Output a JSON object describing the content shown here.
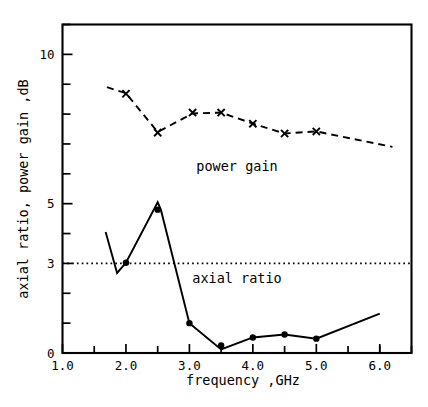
{
  "chart_data": {
    "type": "line",
    "title": "",
    "xlabel": "frequency ,GHz",
    "ylabel": "axial ratio, power gain ,dB",
    "xlim": [
      1.0,
      6.5
    ],
    "ylim": [
      0,
      11.0
    ],
    "grid": false,
    "legend_position": "inline-annotation",
    "x_tick_labels": [
      "1.0",
      "2.0",
      "3.0",
      "4.0",
      "5.0",
      "6.0"
    ],
    "x_tick_values": [
      1.0,
      2.0,
      3.0,
      4.0,
      5.0,
      6.0
    ],
    "x_minor_tick_values": [
      1.5,
      2.5,
      3.5,
      4.5,
      5.5,
      6.0,
      6.5
    ],
    "y_tick_labels": [
      "0",
      "3",
      "5",
      "10"
    ],
    "y_tick_values": [
      0,
      3,
      5,
      10
    ],
    "y_minor_tick_values": [
      1,
      2,
      4,
      6,
      7,
      8,
      9,
      11
    ],
    "reference_lines": [
      {
        "name": "axial-ratio-3dB-threshold",
        "value": 3,
        "axis": "y",
        "style": "dotted",
        "label": ""
      }
    ],
    "series": [
      {
        "name": "power gain",
        "annotation": "power gain",
        "annotation_x": 3.75,
        "annotation_y": 6.1,
        "style": "dashed",
        "marker": "x",
        "line_x": [
          1.7,
          2.0,
          2.5,
          3.05,
          3.5,
          4.0,
          4.5,
          5.0,
          6.2
        ],
        "line_y": [
          8.9,
          8.7,
          7.4,
          8.02,
          8.05,
          7.68,
          7.35,
          7.42,
          6.9
        ],
        "marker_x": [
          2.0,
          2.5,
          3.05,
          3.5,
          4.0,
          4.5,
          5.0
        ],
        "marker_y": [
          8.68,
          7.38,
          8.05,
          8.05,
          7.68,
          7.35,
          7.42
        ]
      },
      {
        "name": "axial ratio",
        "annotation": "axial ratio",
        "annotation_x": 3.75,
        "annotation_y": 2.35,
        "style": "solid",
        "marker": "dot",
        "line_x": [
          1.68,
          1.86,
          2.0,
          2.5,
          2.55,
          3.0,
          3.5,
          4.0,
          4.5,
          5.0,
          6.0
        ],
        "line_y": [
          4.05,
          2.68,
          3.02,
          5.05,
          4.8,
          1.0,
          0.12,
          0.52,
          0.62,
          0.48,
          1.32
        ],
        "marker_x": [
          2.0,
          2.5,
          3.0,
          3.5,
          4.0,
          4.5,
          5.0
        ],
        "marker_y": [
          3.02,
          4.8,
          1.0,
          0.25,
          0.52,
          0.62,
          0.48
        ]
      }
    ]
  }
}
